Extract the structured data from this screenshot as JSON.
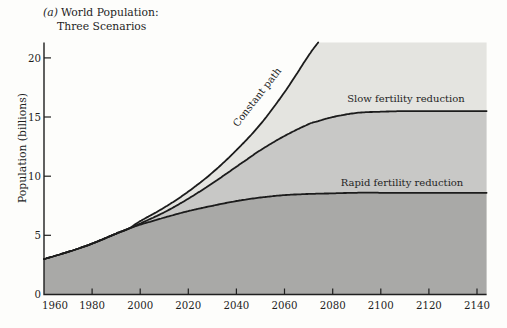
{
  "colors": {
    "band_top": "#e4e4e0",
    "band_middle": "#c8c8c6",
    "band_bottom": "#a9a9a7",
    "curve": "#1c1c1c",
    "axis": "#1f1f1f",
    "text": "#1f1f1f",
    "background": "#fdfdfb"
  },
  "chart_data": {
    "type": "area",
    "title_prefix": "(a)",
    "title_line1": "World Population:",
    "title_line2": "Three Scenarios",
    "ylabel": "Population (billions)",
    "xlabel": "",
    "grid": false,
    "legend": "inline annotations on curves",
    "xlim": [
      1960,
      2144
    ],
    "ylim": [
      0,
      21.3
    ],
    "x_ticks": [
      1960,
      1980,
      2000,
      2020,
      2040,
      2060,
      2080,
      2100,
      2120,
      2140
    ],
    "y_ticks": [
      0,
      5,
      10,
      15,
      20
    ],
    "x": [
      1960,
      1970,
      1980,
      1990,
      1995,
      2000,
      2010,
      2020,
      2030,
      2040,
      2050,
      2060,
      2070,
      2074,
      2080,
      2090,
      2100,
      2110,
      2120,
      2130,
      2140,
      2144
    ],
    "series": [
      {
        "name": "Constant path",
        "values": [
          3.0,
          3.6,
          4.3,
          5.15,
          5.55,
          6.2,
          7.35,
          8.7,
          10.3,
          12.2,
          14.4,
          17.1,
          20.2,
          21.3,
          null,
          null,
          null,
          null,
          null,
          null,
          null,
          null
        ]
      },
      {
        "name": "Slow fertility reduction",
        "values": [
          3.0,
          3.6,
          4.3,
          5.15,
          5.55,
          6.0,
          6.95,
          8.1,
          9.4,
          10.8,
          12.2,
          13.4,
          14.4,
          14.65,
          15.0,
          15.35,
          15.45,
          15.5,
          15.5,
          15.5,
          15.5,
          15.5
        ]
      },
      {
        "name": "Rapid fertility reduction",
        "values": [
          3.0,
          3.6,
          4.3,
          5.15,
          5.55,
          5.9,
          6.5,
          7.05,
          7.5,
          7.9,
          8.2,
          8.4,
          8.5,
          8.52,
          8.55,
          8.6,
          8.6,
          8.6,
          8.6,
          8.6,
          8.6,
          8.6
        ]
      }
    ]
  }
}
